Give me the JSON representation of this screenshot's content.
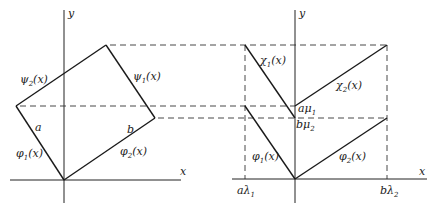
{
  "left_panel": {
    "axis_x_label": "x",
    "axis_y_label": "y",
    "labels": {
      "psi2": {
        "base": "ψ",
        "sub": "2",
        "arg": "(x)"
      },
      "psi1": {
        "base": "ψ",
        "sub": "1",
        "arg": "(x)"
      },
      "phi1": {
        "base": "φ",
        "sub": "1",
        "arg": "(x)"
      },
      "phi2": {
        "base": "φ",
        "sub": "2",
        "arg": "(x)"
      },
      "a": "a",
      "b": "b"
    }
  },
  "right_panel": {
    "axis_x_label": "x",
    "axis_y_label": "y",
    "labels": {
      "chi1": {
        "base": "χ",
        "sub": "1",
        "arg": "(x)"
      },
      "chi2": {
        "base": "χ",
        "sub": "2",
        "arg": "(x)"
      },
      "phi1": {
        "base": "φ",
        "sub": "1",
        "arg": "(x)"
      },
      "phi2": {
        "base": "φ",
        "sub": "2",
        "arg": "(x)"
      },
      "a_mu1": {
        "base": "aμ",
        "sub": "1"
      },
      "b_mu2": {
        "base": "bμ",
        "sub": "2"
      },
      "a_lambda1": {
        "base": "aλ",
        "sub": "1"
      },
      "b_lambda2": {
        "base": "bλ",
        "sub": "2"
      }
    }
  }
}
